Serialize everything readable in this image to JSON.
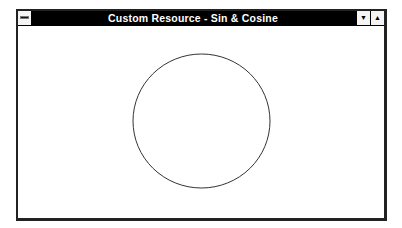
{
  "window": {
    "title": "Custom Resource - Sin & Cosine",
    "system_menu_icon": "system-menu-icon",
    "minimize_icon": "▼",
    "maximize_icon": "▲"
  },
  "client": {
    "figure": "circle",
    "stroke_color": "#333333",
    "center": {
      "x": 201.5,
      "y": 121
    },
    "radius_x": 68.5,
    "radius_y": 67
  }
}
